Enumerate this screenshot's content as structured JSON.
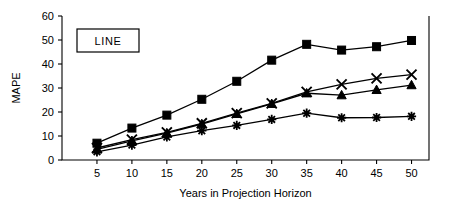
{
  "figure": {
    "legend_label": "LINE"
  },
  "chart_data": {
    "type": "line",
    "title": "",
    "xlabel": "Years in Projection Horizon",
    "ylabel": "MAPE",
    "xlim": [
      0,
      52.5
    ],
    "ylim": [
      0,
      60
    ],
    "xticks": [
      5,
      10,
      15,
      20,
      25,
      30,
      35,
      40,
      45,
      50
    ],
    "xtick_labels": [
      "5",
      "10",
      "15",
      "20",
      "25",
      "30",
      "35",
      "40",
      "45",
      "50"
    ],
    "yticks": [
      0,
      10,
      20,
      30,
      40,
      50,
      60
    ],
    "ytick_labels": [
      "0",
      "10",
      "20",
      "30",
      "40",
      "50",
      "60"
    ],
    "grid": false,
    "legend_position": "none",
    "x": [
      5,
      10,
      15,
      20,
      25,
      30,
      35,
      40,
      45,
      50
    ],
    "series": [
      {
        "name": "square-series",
        "marker": "square",
        "values": [
          7.0,
          13.3,
          18.7,
          25.3,
          32.8,
          41.6,
          48.2,
          45.8,
          47.2,
          49.8
        ]
      },
      {
        "name": "cross-series",
        "marker": "cross",
        "values": [
          5.0,
          8.5,
          11.5,
          15.3,
          19.5,
          23.6,
          28.4,
          31.5,
          34.0,
          35.6
        ]
      },
      {
        "name": "triangle-series",
        "marker": "triangle",
        "values": [
          4.4,
          8.0,
          11.2,
          15.0,
          19.2,
          23.4,
          27.8,
          27.0,
          29.2,
          31.2
        ]
      },
      {
        "name": "asterisk-series",
        "marker": "asterisk",
        "values": [
          3.4,
          6.2,
          9.6,
          12.2,
          14.4,
          16.9,
          19.5,
          17.6,
          17.7,
          18.2
        ]
      }
    ]
  }
}
